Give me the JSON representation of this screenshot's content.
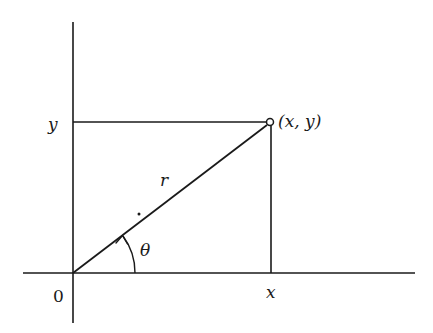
{
  "diagram": {
    "labels": {
      "origin": "0",
      "x_tick": "x",
      "y_tick": "y",
      "point": "(x, y)",
      "radius": "r",
      "angle": "θ"
    },
    "geometry": {
      "origin": [
        73,
        273
      ],
      "point": [
        270,
        122
      ],
      "x_axis": {
        "from": [
          23,
          273
        ],
        "to": [
          415,
          273
        ]
      },
      "y_axis": {
        "from": [
          73,
          22
        ],
        "to": [
          73,
          323
        ]
      },
      "angle_arc_radius": 62
    },
    "colors": {
      "stroke": "#1a1a1a",
      "background": "#ffffff"
    }
  }
}
